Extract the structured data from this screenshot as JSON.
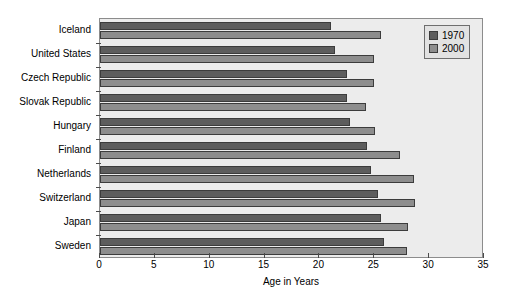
{
  "chart_data": {
    "type": "bar",
    "orientation": "horizontal",
    "title": "",
    "xlabel": "Age in Years",
    "ylabel": "",
    "xlim": [
      0,
      35
    ],
    "xticks": [
      0,
      5,
      10,
      15,
      20,
      25,
      30,
      35
    ],
    "grid": false,
    "legend_position": "top-right",
    "categories": [
      "Iceland",
      "United States",
      "Czech Republic",
      "Slovak Republic",
      "Hungary",
      "Finland",
      "Netherlands",
      "Switzerland",
      "Japan",
      "Sweden"
    ],
    "series": [
      {
        "name": "1970",
        "color": "#5d5d5d",
        "values": [
          21.1,
          21.4,
          22.5,
          22.5,
          22.8,
          24.3,
          24.7,
          25.3,
          25.6,
          25.9
        ]
      },
      {
        "name": "2000",
        "color": "#8d8d8d",
        "values": [
          25.6,
          25.0,
          25.0,
          24.2,
          25.1,
          27.3,
          28.6,
          28.7,
          28.1,
          28.0
        ]
      }
    ]
  },
  "legend": {
    "items": [
      {
        "label": "1970",
        "color": "#5d5d5d"
      },
      {
        "label": "2000",
        "color": "#8d8d8d"
      }
    ]
  },
  "axis": {
    "x_title": "Age in Years",
    "x_tick_labels": [
      "0",
      "5",
      "10",
      "15",
      "20",
      "25",
      "30",
      "35"
    ]
  },
  "colors": {
    "plot_background": "#ececec",
    "plot_border": "#8c8c8c",
    "bar_border": "#3c3c3c",
    "legend_background": "#e2e2e2",
    "legend_border": "#6e6e6e",
    "text": "#000000"
  }
}
